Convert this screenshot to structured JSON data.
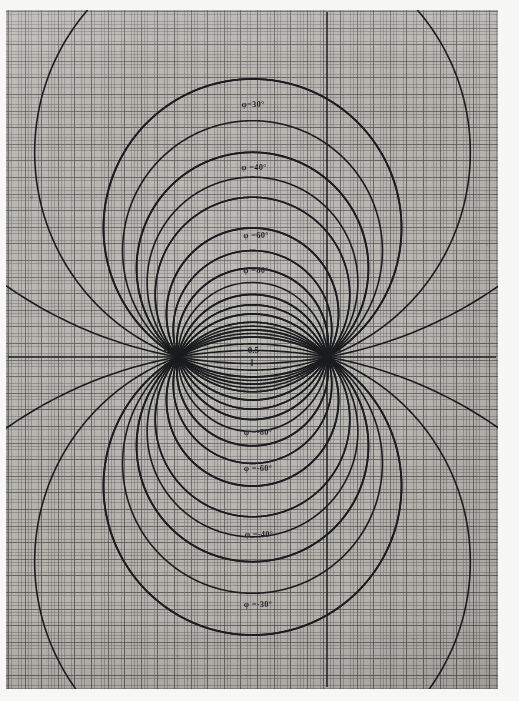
{
  "figure": {
    "title": "",
    "medium": "scanned graph paper",
    "paper_color": "#b8b6b1",
    "ink_color": "#1b1c1e",
    "grid_minor_color": "#5c5c5a",
    "grid_major_color": "#3c3c3a"
  },
  "axes": {
    "x_axis_name": "horizontal-axis",
    "y_axis_name": "vertical-axis",
    "x_axis_y_pixel": 357,
    "y_axis_x_pixel": 327,
    "ticks": [
      {
        "label": "-1",
        "x": -1.0,
        "px": 178
      },
      {
        "label": "-0.5",
        "x": -0.5,
        "px": 252
      },
      {
        "label": "0",
        "x": 0.0,
        "px": 327
      }
    ]
  },
  "chart_data": {
    "type": "line",
    "title": "",
    "subtitle": "",
    "xlabel": "",
    "ylabel": "",
    "grid": true,
    "legend_position": "inline-labels",
    "singular_points": [
      {
        "label": "-1",
        "x": -1.0,
        "y": 0.0
      },
      {
        "label": "0",
        "x": 0.0,
        "y": 0.0
      }
    ],
    "xlim": [
      -2.12,
      1.17
    ],
    "ylim": [
      -2.34,
      2.34
    ],
    "labeled_curves": [
      {
        "name": "phi-30",
        "label": "φ=30°",
        "phi_deg": 30,
        "apex_x": -0.5,
        "apex_y": 1.866,
        "label_px": {
          "x": 253,
          "y": 104
        }
      },
      {
        "name": "phi-40",
        "label": "φ =40°",
        "phi_deg": 40,
        "apex_x": -0.5,
        "apex_y": 1.192,
        "label_px": {
          "x": 254,
          "y": 167
        }
      },
      {
        "name": "phi-60",
        "label": "φ =60°",
        "phi_deg": 60,
        "apex_x": -0.5,
        "apex_y": 0.577,
        "label_px": {
          "x": 256,
          "y": 235
        }
      },
      {
        "name": "phi-80",
        "label": "φ =80°",
        "phi_deg": 80,
        "apex_x": -0.5,
        "apex_y": 0.268,
        "label_px": {
          "x": 256,
          "y": 270
        }
      },
      {
        "name": "phi-m80",
        "label": "φ =-80°",
        "phi_deg": -80,
        "apex_x": -0.5,
        "apex_y": -0.268,
        "label_px": {
          "x": 258,
          "y": 432
        }
      },
      {
        "name": "phi-m60",
        "label": "φ =-60°",
        "phi_deg": -60,
        "apex_x": -0.5,
        "apex_y": -0.577,
        "label_px": {
          "x": 258,
          "y": 468
        }
      },
      {
        "name": "phi-m40",
        "label": "φ =-40°",
        "phi_deg": -40,
        "apex_x": -0.5,
        "apex_y": -1.192,
        "label_px": {
          "x": 259,
          "y": 534
        }
      },
      {
        "name": "phi-m30",
        "label": "φ =-30°",
        "phi_deg": -30,
        "apex_x": -0.5,
        "apex_y": -1.866,
        "label_px": {
          "x": 258,
          "y": 604
        }
      }
    ],
    "all_curve_angles_deg": [
      30,
      35,
      40,
      45,
      50,
      60,
      70,
      80,
      90,
      100,
      110,
      120,
      130,
      140,
      150,
      160,
      170,
      -30,
      -35,
      -40,
      -45,
      -50,
      -60,
      -70,
      -80,
      -90,
      -100,
      -110,
      -120,
      -130,
      -140,
      -150,
      -160,
      -170
    ],
    "series": [
      {
        "name": "arc-phi-30",
        "phi_deg": 30
      },
      {
        "name": "arc-phi-35",
        "phi_deg": 35
      },
      {
        "name": "arc-phi-40",
        "phi_deg": 40
      },
      {
        "name": "arc-phi-45",
        "phi_deg": 45
      },
      {
        "name": "arc-phi-50",
        "phi_deg": 50
      },
      {
        "name": "arc-phi-60",
        "phi_deg": 60
      },
      {
        "name": "arc-phi-70",
        "phi_deg": 70
      },
      {
        "name": "arc-phi-80",
        "phi_deg": 80
      },
      {
        "name": "arc-phi-90",
        "phi_deg": 90
      },
      {
        "name": "arc-phi-100",
        "phi_deg": 100
      },
      {
        "name": "arc-phi-110",
        "phi_deg": 110
      },
      {
        "name": "arc-phi-120",
        "phi_deg": 120
      },
      {
        "name": "arc-phi-130",
        "phi_deg": 130
      },
      {
        "name": "arc-phi-140",
        "phi_deg": 140
      },
      {
        "name": "arc-phi-150",
        "phi_deg": 150
      },
      {
        "name": "arc-phi-160",
        "phi_deg": 160
      },
      {
        "name": "arc-phi-170",
        "phi_deg": 170
      }
    ]
  }
}
